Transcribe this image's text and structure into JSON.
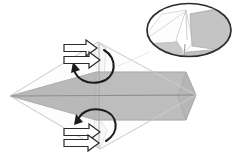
{
  "figure": {
    "width": 241,
    "height": 154,
    "background_color": "#ffffff"
  },
  "colors": {
    "paper_front": "#bdbdbd",
    "paper_front_dark": "#b2b2b2",
    "paper_back": "#ffffff",
    "paper_back_shade": "#f2f2f2",
    "inset_gray": "#c4c4c4",
    "inset_gray_dark": "#a9a9a9",
    "inset_white": "#fdfdfd",
    "outline_light": "#d5d5d5",
    "outline_mid": "#9a9a9a",
    "outline_dark": "#4a4a4a",
    "arrow_stroke": "#2b2b2b",
    "arrow_fill": "#ffffff",
    "rotation_arrow": "#1c1c1c",
    "ellipse_stroke": "#2b2b2b"
  },
  "main_shape": {
    "name": "folded-paper-model",
    "left_tip": [
      10,
      96
    ],
    "right_tip": [
      196,
      95
    ],
    "top_apex": [
      98,
      42
    ],
    "bottom_apex": [
      100,
      149
    ],
    "center_line_y": 96,
    "notes": "Elongated horizontal body with pointed left tip and chevron right tip; translucent outer kite outline visible in pale gray."
  },
  "arrows": {
    "push_arrows": [
      {
        "name": "push-arrow-top-upper",
        "x": 64,
        "y": 47,
        "direction": "right",
        "length": 32
      },
      {
        "name": "push-arrow-top-lower",
        "x": 64,
        "y": 58,
        "direction": "right",
        "length": 32
      },
      {
        "name": "push-arrow-bottom-upper",
        "x": 64,
        "y": 133,
        "direction": "right",
        "length": 32
      },
      {
        "name": "push-arrow-bottom-lower",
        "x": 64,
        "y": 144,
        "direction": "right",
        "length": 32
      }
    ],
    "rotation_arrows": [
      {
        "name": "rotation-arrow-top",
        "center": [
          98,
          68
        ],
        "sweep": "counterclockwise",
        "head_at": [
          73,
          68
        ]
      },
      {
        "name": "rotation-arrow-bottom",
        "center": [
          99,
          126
        ],
        "sweep": "counterclockwise",
        "head_at": [
          76,
          126
        ]
      }
    ]
  },
  "inset": {
    "name": "magnified-detail-inset",
    "shape": "ellipse",
    "center": [
      189,
      30
    ],
    "radius_x": 43,
    "radius_y": 27,
    "content_description": "Close-up of the folded corner: a pale white V-shaped flap between two gray triangular paper faces."
  },
  "labels": {
    "caption": ""
  }
}
